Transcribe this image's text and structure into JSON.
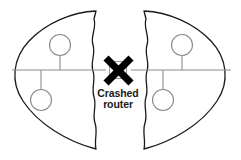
{
  "diagram": {
    "type": "network-topology",
    "canvas": {
      "width": 241,
      "height": 160,
      "background": "#ffffff"
    },
    "colors": {
      "outline": "#1a1a1a",
      "link": "#8a8a8a",
      "node_fill": "#ffffff",
      "x_mark": "#000000",
      "text": "#1a1a1a"
    },
    "caption": {
      "line1": "Crashed",
      "line2": "router",
      "full_text": "Crashed router"
    },
    "router": {
      "label": "Crashed router",
      "status": "crashed",
      "marked_with": "x-cross",
      "cx": 118,
      "cy": 70,
      "box_size": 17
    },
    "bus": {
      "y": 70,
      "x_start": 12,
      "x_end": 231
    },
    "partitions": [
      {
        "name": "left-partition",
        "side": "left",
        "torn_edge": "right"
      },
      {
        "name": "right-partition",
        "side": "right",
        "torn_edge": "left"
      }
    ],
    "hosts": [
      {
        "name": "host-upper-left",
        "partition": "left",
        "cx": 60,
        "cy": 45,
        "r": 10.5,
        "stem_to_y": 70
      },
      {
        "name": "host-lower-left",
        "partition": "left",
        "cx": 41,
        "cy": 100,
        "r": 10.5,
        "stem_to_y": 70
      },
      {
        "name": "host-upper-right",
        "partition": "right",
        "cx": 182,
        "cy": 45,
        "r": 10.5,
        "stem_to_y": 70
      },
      {
        "name": "host-lower-right",
        "partition": "right",
        "cx": 163,
        "cy": 100,
        "r": 10.5,
        "stem_to_y": 70
      }
    ],
    "x_mark": {
      "stroke1": {
        "x1": 106,
        "y1": 58,
        "x2": 131,
        "y2": 83
      },
      "stroke2": {
        "x1": 131,
        "y1": 58,
        "x2": 106,
        "y2": 83
      }
    },
    "shapes": {
      "left_half_path": "M 96,11 C 72,12 46,23 29,41 C 13,58 10,82 23,101 C 38,124 68,142 96,149 C 94,140 98,132 95,123 C 92,114 97,106 94,97 C 91,88 96,80 93,71 C 90,62 96,54 93,45 C 90,36 97,28 94,19 Z",
      "right_half_path": "M 144,11 C 168,12 194,23 211,41 C 227,58 230,82 217,101 C 202,124 172,142 144,149 C 146,140 142,132 145,123 C 148,114 143,106 146,97 C 149,88 144,80 147,71 C 150,62 144,54 147,45 C 150,36 143,28 146,19 Z"
    }
  }
}
